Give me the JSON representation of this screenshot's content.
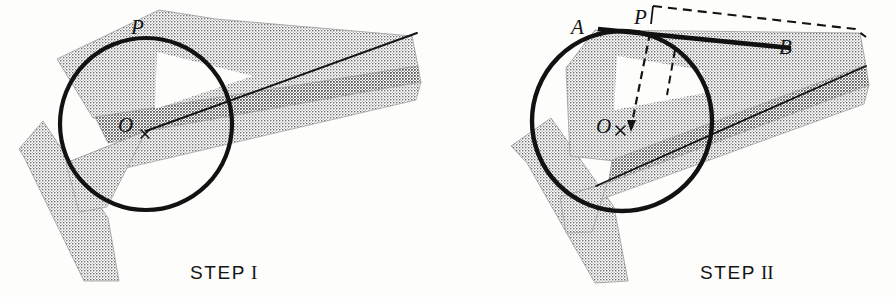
{
  "figure": {
    "background_color": "#fdfdfc",
    "ink_color": "#141414",
    "stipple_color": "#8a8a8a"
  },
  "panels": [
    {
      "id": "step-1",
      "caption_word": "STEP",
      "caption_numeral": "I",
      "circle": {
        "cx": 146,
        "cy": 124,
        "r": 86
      },
      "labels": [
        {
          "name": "point-p",
          "text": "P",
          "x": 131,
          "y": 34
        },
        {
          "name": "point-o",
          "text": "O",
          "x": 124,
          "y": 132
        },
        {
          "name": "center-mark",
          "text": "×",
          "x": 141,
          "y": 139
        }
      ]
    },
    {
      "id": "step-2",
      "caption_word": "STEP",
      "caption_numeral": "II",
      "circle": {
        "cx": 622,
        "cy": 121,
        "r": 90
      },
      "labels": [
        {
          "name": "point-a",
          "text": "A",
          "x": 578,
          "y": 30
        },
        {
          "name": "point-p",
          "text": "P",
          "x": 640,
          "y": 22
        },
        {
          "name": "point-b",
          "text": "B",
          "x": 783,
          "y": 49
        },
        {
          "name": "point-o",
          "text": "O",
          "x": 601,
          "y": 131
        },
        {
          "name": "center-mark",
          "text": "×",
          "x": 618,
          "y": 134
        }
      ]
    }
  ],
  "chord": {
    "label_a": "A",
    "label_b": "B",
    "from": {
      "x": 598,
      "y": 29
    },
    "to": {
      "x": 791,
      "y": 48
    }
  }
}
